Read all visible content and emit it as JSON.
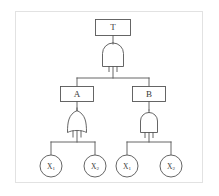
{
  "figure": {
    "name": "fault-tree-diagram",
    "background_color": "#ffffff",
    "border_color": "#e2e2e2",
    "stroke_color": "#555555",
    "text_color": "#3a3a3a"
  },
  "nodes": {
    "top_event": {
      "label": "T",
      "type": "event-box"
    },
    "intermediate_left": {
      "label": "A",
      "type": "event-box"
    },
    "intermediate_right": {
      "label": "B",
      "type": "event-box"
    },
    "basic_1": {
      "label": "X",
      "subscript": "1",
      "type": "basic-event-circle"
    },
    "basic_2": {
      "label": "X",
      "subscript": "2",
      "type": "basic-event-circle"
    },
    "basic_3": {
      "label": "X",
      "subscript": "1",
      "type": "basic-event-circle"
    },
    "basic_4": {
      "label": "X",
      "subscript": "2",
      "type": "basic-event-circle"
    }
  },
  "gates": {
    "top_gate": {
      "type": "AND",
      "parent": "T",
      "children": [
        "A",
        "B"
      ]
    },
    "left_gate": {
      "type": "OR",
      "parent": "A",
      "children": [
        "X1",
        "X2"
      ]
    },
    "right_gate": {
      "type": "AND",
      "parent": "B",
      "children": [
        "X1",
        "X2"
      ]
    }
  }
}
